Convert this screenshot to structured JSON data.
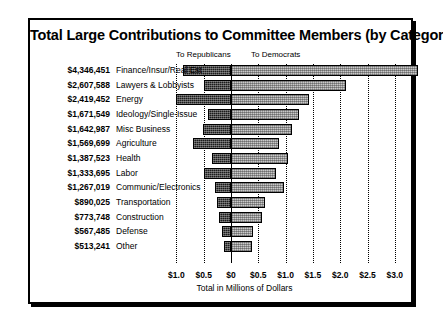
{
  "chart_data": {
    "type": "bar",
    "orientation": "horizontal",
    "subtype": "diverging-stacked",
    "title": "Total Large Contributions to Committee Members (by Category)",
    "xlabel": "Total in Millions of Dollars",
    "ylabel": "",
    "grid": true,
    "legend_position": "top",
    "xlim": [
      -1.25,
      3.25
    ],
    "xticks": [
      -1.0,
      -0.5,
      0,
      0.5,
      1.0,
      1.5,
      2.0,
      2.5,
      3.0
    ],
    "xticklabels": [
      "$1.0",
      "$0.5",
      "$0",
      "$0.5",
      "$1.0",
      "$1.5",
      "$2.0",
      "$2.5",
      "$3.0"
    ],
    "legend": [
      {
        "name": "To Republicans",
        "direction": "left",
        "color": "#1c1c1c"
      },
      {
        "name": "To Democrats",
        "direction": "right",
        "color": "#c9c9c9"
      }
    ],
    "categories": [
      "Finance/Insur/Real Est",
      "Lawyers & Lobbyists",
      "Energy",
      "Ideology/Single-Issue",
      "Misc Business",
      "Agriculture",
      "Health",
      "Labor",
      "Communic/Electronics",
      "Transportation",
      "Construction",
      "Defense",
      "Other"
    ],
    "totals_display": [
      "$4,346,451",
      "$2,607,588",
      "$2,419,452",
      "$1,671,549",
      "$1,642,987",
      "$1,569,699",
      "$1,387,523",
      "$1,333,695",
      "$1,267,019",
      "$890,025",
      "$773,748",
      "$567,485",
      "$513,241"
    ],
    "totals": [
      4346451,
      2607588,
      2419452,
      1671549,
      1642987,
      1569699,
      1387523,
      1333695,
      1267019,
      890025,
      773748,
      567485,
      513241
    ],
    "series": [
      {
        "name": "To Republicans",
        "values": [
          0.88,
          0.5,
          1.0,
          0.42,
          0.52,
          0.7,
          0.34,
          0.5,
          0.3,
          0.26,
          0.22,
          0.17,
          0.13
        ]
      },
      {
        "name": "To Democrats",
        "values": [
          3.43,
          2.1,
          1.43,
          1.25,
          1.12,
          0.88,
          1.05,
          0.83,
          0.97,
          0.63,
          0.56,
          0.4,
          0.38
        ]
      }
    ]
  }
}
